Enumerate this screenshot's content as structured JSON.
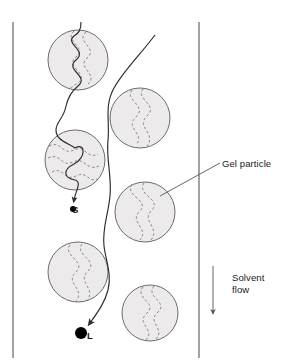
{
  "figure": {
    "background_color": "#ffffff"
  },
  "column": {
    "wall_color": "#555555",
    "left_wall_x": 13,
    "right_wall_x": 199,
    "top_y": 22,
    "bottom_y": 358
  },
  "labels": {
    "gel_particle": "Gel particle",
    "solvent_flow_line1": "Solvent",
    "solvent_flow_line2": "flow",
    "small_molecule": "S",
    "large_molecule": "L"
  },
  "particles": {
    "fill_color": "#eceaea",
    "stroke_color": "#6b6b6b",
    "pore_channel_color": "#8a8a8a",
    "pore_channel_style": "dashed",
    "count": 6,
    "items": [
      {
        "id": "particle-top-left",
        "cx": 78,
        "cy": 60,
        "r": 30
      },
      {
        "id": "particle-top-right",
        "cx": 140,
        "cy": 118,
        "r": 30
      },
      {
        "id": "particle-mid-left",
        "cx": 75,
        "cy": 160,
        "r": 30
      },
      {
        "id": "particle-mid-right",
        "cx": 145,
        "cy": 212,
        "r": 30
      },
      {
        "id": "particle-low-left",
        "cx": 78,
        "cy": 272,
        "r": 30
      },
      {
        "id": "particle-low-right",
        "cx": 150,
        "cy": 313,
        "r": 28
      }
    ]
  },
  "paths": {
    "small_molecule_path_color": "#2b2b2b",
    "large_molecule_path_color": "#2b2b2b",
    "small_molecule_description": "Small solute threads through the interior pores of the gel particles, travelling a long tortuous route and eluting slowly.",
    "large_molecule_description": "Large solute is excluded from the pores and flows around the particles, travelling a short route and eluting first."
  },
  "markers": {
    "small_dot_radius": 3,
    "large_dot_radius": 6,
    "dot_color": "#000000"
  },
  "arrows": {
    "solvent_flow_arrow": {
      "x": 213,
      "y_start": 266,
      "y_end": 318,
      "color": "#555555"
    }
  },
  "leader_lines": {
    "gel_particle_leader": {
      "from_x": 220,
      "from_y": 163,
      "to_x": 160,
      "to_y": 196,
      "color": "#555555"
    }
  }
}
